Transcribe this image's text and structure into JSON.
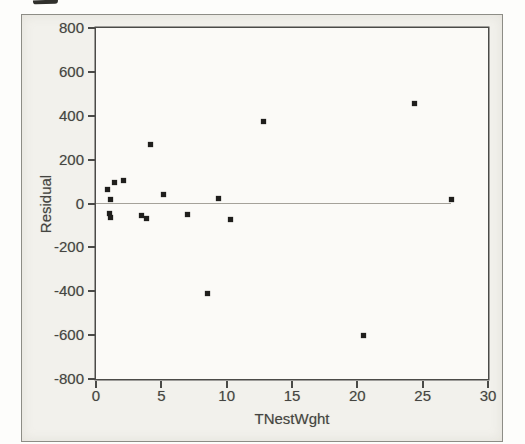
{
  "chart_data": {
    "type": "scatter",
    "xlabel": "TNestWght",
    "ylabel": "Residual",
    "xlim": [
      0,
      30
    ],
    "ylim": [
      -800,
      800
    ],
    "xticks": [
      0,
      5,
      10,
      15,
      20,
      25,
      30
    ],
    "xtick_labels": [
      "0",
      "5",
      "10",
      "15",
      "20",
      "25",
      "30"
    ],
    "yticks": [
      800,
      600,
      400,
      200,
      0,
      -200,
      -400,
      -600,
      -800
    ],
    "ytick_labels": [
      "800",
      "600",
      "400",
      "200",
      "0",
      "-200",
      "-400",
      "-600",
      "-800"
    ],
    "grid": false,
    "legend": "none",
    "marker": "filled-square",
    "reference_line": {
      "y": 0,
      "x_start": 0,
      "x_end": 27.2
    },
    "points": [
      [
        0.9,
        65
      ],
      [
        1.4,
        95
      ],
      [
        2.1,
        105
      ],
      [
        1.1,
        20
      ],
      [
        1.0,
        -45
      ],
      [
        1.1,
        -65
      ],
      [
        3.5,
        -55
      ],
      [
        3.9,
        -70
      ],
      [
        4.2,
        270
      ],
      [
        5.2,
        40
      ],
      [
        7.0,
        -48
      ],
      [
        8.5,
        -410
      ],
      [
        9.4,
        25
      ],
      [
        10.3,
        -75
      ],
      [
        12.8,
        375
      ],
      [
        20.5,
        -600
      ],
      [
        24.4,
        455
      ],
      [
        27.2,
        20
      ]
    ],
    "colors": {
      "point": "#1f1e1c",
      "zero_line": "#a5a29a",
      "plot_frame": "#4b4b48",
      "figure_background": "#f2f1ec",
      "plot_background": "#fbfaf7"
    }
  }
}
